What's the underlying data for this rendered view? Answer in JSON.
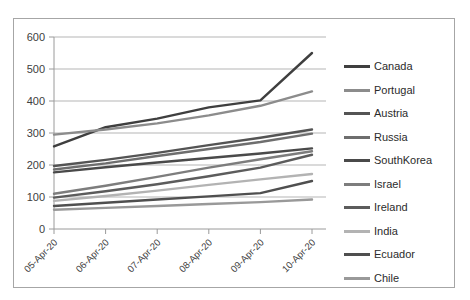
{
  "chart_data": {
    "type": "line",
    "title": "",
    "xlabel": "",
    "ylabel": "",
    "ylim": [
      0,
      600
    ],
    "yticks": [
      0,
      100,
      200,
      300,
      400,
      500,
      600
    ],
    "grid": true,
    "legend_position": "right",
    "categories": [
      "05-Apr-20",
      "06-Apr-20",
      "07-Apr-20",
      "08-Apr-20",
      "09-Apr-20",
      "10-Apr-20"
    ],
    "series": [
      {
        "name": "Canada",
        "color": "#3f3f3f",
        "values": [
          258,
          318,
          345,
          380,
          402,
          550
        ]
      },
      {
        "name": "Portugal",
        "color": "#8c8c8c",
        "values": [
          295,
          311,
          330,
          355,
          385,
          430
        ]
      },
      {
        "name": "Austria",
        "color": "#545454",
        "values": [
          197,
          216,
          238,
          262,
          285,
          311
        ]
      },
      {
        "name": "Russia",
        "color": "#6e6e6e",
        "values": [
          186,
          205,
          228,
          250,
          272,
          298
        ]
      },
      {
        "name": "SouthKorea",
        "color": "#4a4a4a",
        "values": [
          177,
          193,
          208,
          222,
          236,
          252
        ]
      },
      {
        "name": "Israel",
        "color": "#7d7d7d",
        "values": [
          110,
          135,
          163,
          192,
          218,
          243
        ]
      },
      {
        "name": "Ireland",
        "color": "#5c5c5c",
        "values": [
          98,
          118,
          140,
          165,
          192,
          232
        ]
      },
      {
        "name": "India",
        "color": "#b3b3b3",
        "values": [
          88,
          103,
          120,
          138,
          155,
          172
        ]
      },
      {
        "name": "Ecuador",
        "color": "#4f4f4f",
        "values": [
          72,
          82,
          92,
          102,
          112,
          150
        ]
      },
      {
        "name": "Chile",
        "color": "#999999",
        "values": [
          60,
          66,
          72,
          78,
          84,
          92
        ]
      }
    ]
  },
  "legend": {
    "items": [
      {
        "label": "Canada"
      },
      {
        "label": "Portugal"
      },
      {
        "label": "Austria"
      },
      {
        "label": "Russia"
      },
      {
        "label": "SouthKorea"
      },
      {
        "label": "Israel"
      },
      {
        "label": "Ireland"
      },
      {
        "label": "India"
      },
      {
        "label": "Ecuador"
      },
      {
        "label": "Chile"
      }
    ]
  },
  "axes": {
    "gridline_color": "#b5b5b5",
    "axis_color": "#9a9a9a",
    "tick_label_color": "#404040"
  }
}
